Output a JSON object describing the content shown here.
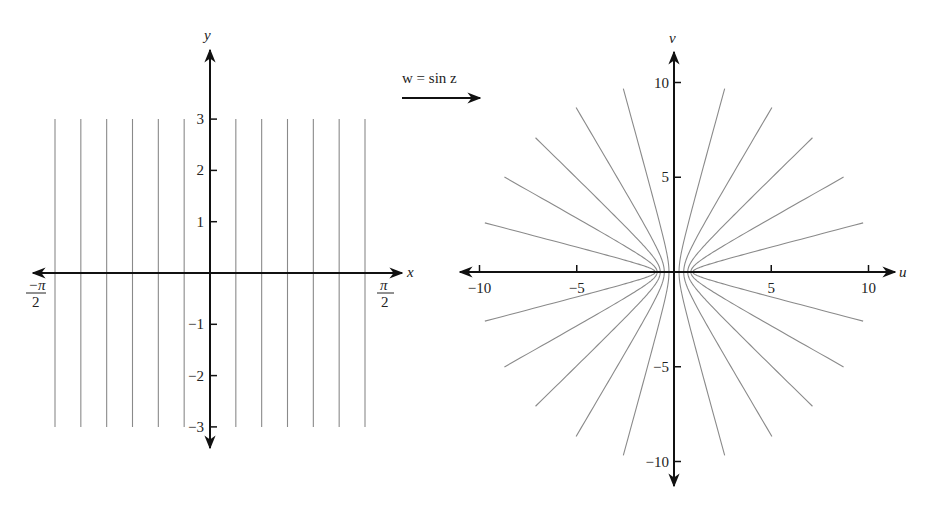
{
  "mapping": {
    "label": "w = sin z"
  },
  "left_plot": {
    "x_axis_label": "x",
    "y_axis_label": "y",
    "y_ticks": [
      {
        "value": 3,
        "label": "3"
      },
      {
        "value": 2,
        "label": "2"
      },
      {
        "value": 1,
        "label": "1"
      },
      {
        "value": -1,
        "label": "−1"
      },
      {
        "value": -2,
        "label": "−2"
      },
      {
        "value": -3,
        "label": "−3"
      }
    ],
    "x_tick_left": {
      "numerator": "−π",
      "denominator": "2"
    },
    "x_tick_right": {
      "numerator": "π",
      "denominator": "2"
    }
  },
  "right_plot": {
    "x_axis_label": "u",
    "y_axis_label": "v",
    "u_ticks": [
      {
        "value": -10,
        "label": "−10"
      },
      {
        "value": -5,
        "label": "−5"
      },
      {
        "value": 5,
        "label": "5"
      },
      {
        "value": 10,
        "label": "10"
      }
    ],
    "v_ticks": [
      {
        "value": 10,
        "label": "10"
      },
      {
        "value": 5,
        "label": "5"
      },
      {
        "value": -5,
        "label": "−5"
      },
      {
        "value": -10,
        "label": "−10"
      }
    ]
  },
  "chart_data": [
    {
      "type": "line",
      "title": "z-plane: vertical lines x = c",
      "xlabel": "x",
      "ylabel": "y",
      "xlim": [
        -1.5708,
        1.5708
      ],
      "ylim": [
        -3,
        3
      ],
      "series": [
        {
          "name": "x = -π/2",
          "x": -1.5708,
          "y_range": [
            -3,
            3
          ]
        },
        {
          "name": "x = -5π/12",
          "x": -1.309,
          "y_range": [
            -3,
            3
          ]
        },
        {
          "name": "x = -π/3",
          "x": -1.0472,
          "y_range": [
            -3,
            3
          ]
        },
        {
          "name": "x = -π/4",
          "x": -0.7854,
          "y_range": [
            -3,
            3
          ]
        },
        {
          "name": "x = -π/6",
          "x": -0.5236,
          "y_range": [
            -3,
            3
          ]
        },
        {
          "name": "x = -π/12",
          "x": -0.2618,
          "y_range": [
            -3,
            3
          ]
        },
        {
          "name": "x = π/12",
          "x": 0.2618,
          "y_range": [
            -3,
            3
          ]
        },
        {
          "name": "x = π/6",
          "x": 0.5236,
          "y_range": [
            -3,
            3
          ]
        },
        {
          "name": "x = π/4",
          "x": 0.7854,
          "y_range": [
            -3,
            3
          ]
        },
        {
          "name": "x = π/3",
          "x": 1.0472,
          "y_range": [
            -3,
            3
          ]
        },
        {
          "name": "x = 5π/12",
          "x": 1.309,
          "y_range": [
            -3,
            3
          ]
        },
        {
          "name": "x = π/2",
          "x": 1.5708,
          "y_range": [
            -3,
            3
          ]
        }
      ]
    },
    {
      "type": "line",
      "title": "w-plane: images under w = sin z (hyperbola branches u = sin c·cosh y, v = cos c·sinh y)",
      "xlabel": "u",
      "ylabel": "v",
      "xlim": [
        -10.5,
        10.5
      ],
      "ylim": [
        -10.5,
        10.5
      ],
      "series": [
        {
          "name": "image of x = ±π/12",
          "c": 0.2618
        },
        {
          "name": "image of x = ±π/6",
          "c": 0.5236
        },
        {
          "name": "image of x = ±π/4",
          "c": 0.7854
        },
        {
          "name": "image of x = ±π/3",
          "c": 1.0472
        },
        {
          "name": "image of x = ±5π/12",
          "c": 1.309
        },
        {
          "name": "image of x = ±π/2",
          "c": 1.5708
        }
      ]
    }
  ]
}
